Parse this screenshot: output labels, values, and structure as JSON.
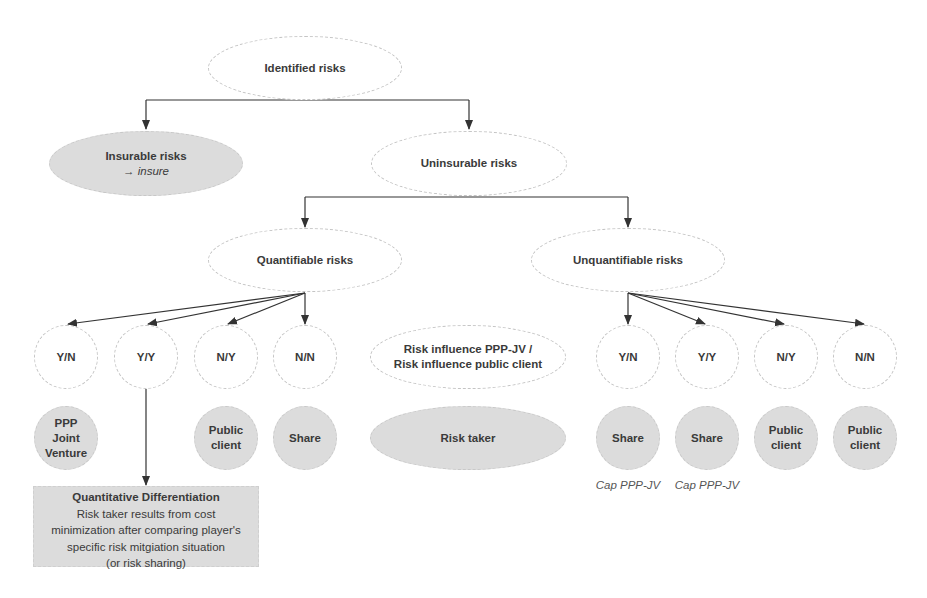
{
  "diagram": {
    "root": {
      "label": "Identified risks"
    },
    "insurable": {
      "label": "Insurable risks",
      "sublabel": "→ insure"
    },
    "uninsurable": {
      "label": "Uninsurable risks"
    },
    "quantifiable": {
      "label": "Quantifiable risks"
    },
    "unquantifiable": {
      "label": "Unquantifiable risks"
    },
    "legend_influence": {
      "line1": "Risk influence PPP-JV /",
      "line2": "Risk influence public client"
    },
    "legend_taker": {
      "label": "Risk taker"
    },
    "quantifiable_cases": [
      {
        "combo": "Y/N",
        "taker": "PPP Joint Venture"
      },
      {
        "combo": "Y/Y",
        "taker": ""
      },
      {
        "combo": "N/Y",
        "taker": "Public client"
      },
      {
        "combo": "N/N",
        "taker": "Share"
      }
    ],
    "unquantifiable_cases": [
      {
        "combo": "Y/N",
        "taker": "Share",
        "note": "Cap PPP-JV"
      },
      {
        "combo": "Y/Y",
        "taker": "Share",
        "note": "Cap PPP-JV"
      },
      {
        "combo": "N/Y",
        "taker": "Public client",
        "note": ""
      },
      {
        "combo": "N/N",
        "taker": "Public client",
        "note": ""
      }
    ],
    "quant_diff_box": {
      "title": "Quantitative Differentiation",
      "lines": [
        "Risk taker results from cost",
        "minimization after comparing player's",
        "specific risk mitgiation situation",
        "(or risk sharing)"
      ]
    },
    "colors": {
      "filled": "#dcdcdc",
      "border": "#c4c4c4",
      "text": "#3a3a3a",
      "arrow": "#333333"
    }
  }
}
